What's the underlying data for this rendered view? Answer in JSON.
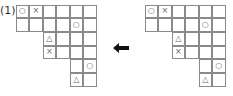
{
  "label": "(1)",
  "arrow": {
    "direction": "left",
    "color": "#111111"
  },
  "grid_shape": [
    [
      0,
      5
    ],
    [
      0,
      5
    ],
    [
      2,
      5
    ],
    [
      2,
      5
    ],
    [
      4,
      5
    ],
    [
      4,
      5
    ]
  ],
  "symbols": {
    "circle": "○",
    "cross": "×",
    "triangle": "△"
  },
  "grids": [
    {
      "name": "left",
      "marks": [
        [
          0,
          0,
          "○"
        ],
        [
          0,
          1,
          "×"
        ],
        [
          1,
          4,
          "○"
        ],
        [
          2,
          2,
          "△"
        ],
        [
          3,
          2,
          "×"
        ],
        [
          4,
          5,
          "○"
        ],
        [
          5,
          4,
          "△"
        ]
      ]
    },
    {
      "name": "right",
      "marks": [
        [
          0,
          0,
          "○"
        ],
        [
          0,
          1,
          "×"
        ],
        [
          1,
          4,
          "○"
        ],
        [
          2,
          2,
          "△"
        ],
        [
          3,
          2,
          "×"
        ],
        [
          4,
          5,
          "○"
        ],
        [
          5,
          4,
          "△"
        ]
      ]
    }
  ]
}
